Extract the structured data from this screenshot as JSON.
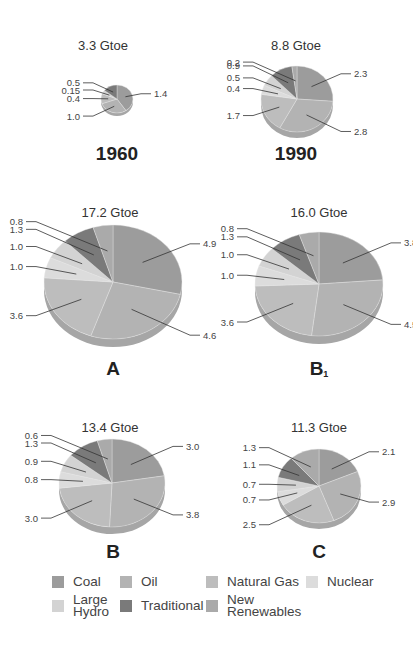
{
  "categories": [
    "Coal",
    "Oil",
    "Natural Gas",
    "Nuclear",
    "Large Hydro",
    "Traditional",
    "New Renewables"
  ],
  "colors": {
    "Coal": "#9c9c9c",
    "Oil": "#b3b3b3",
    "Natural Gas": "#bdbdbd",
    "Nuclear": "#dcdcdc",
    "Large Hydro": "#d3d3d3",
    "Traditional": "#7a7a7a",
    "New Renewables": "#aaaaaa"
  },
  "legend": {
    "items": [
      {
        "label": "Coal",
        "color": "#9c9c9c"
      },
      {
        "label": "Oil",
        "color": "#b3b3b3"
      },
      {
        "label": "Natural Gas",
        "color": "#bdbdbd"
      },
      {
        "label": "Nuclear",
        "color": "#dcdcdc"
      },
      {
        "label": "Large\nHydro",
        "color": "#d3d3d3"
      },
      {
        "label": "Traditional",
        "color": "#7a7a7a"
      },
      {
        "label": "New\nRenewables",
        "color": "#aaaaaa"
      }
    ]
  },
  "chart_data": [
    {
      "type": "pie",
      "title": "1960",
      "total_label": "3.3 Gtoe",
      "total": 3.3,
      "categories": [
        "Coal",
        "Oil",
        "Natural Gas",
        "Nuclear",
        "Large Hydro",
        "Traditional",
        "New Renewables"
      ],
      "values": [
        1.4,
        1.0,
        0.4,
        0.0,
        0.15,
        0.5,
        0.0
      ],
      "labels": {
        "Coal": "1.4",
        "Oil": "1.0",
        "Natural Gas": "0.4",
        "Large Hydro": "0.15",
        "Traditional": "0.5"
      }
    },
    {
      "type": "pie",
      "title": "1990",
      "total_label": "8.8 Gtoe",
      "total": 8.8,
      "categories": [
        "Coal",
        "Oil",
        "Natural Gas",
        "Nuclear",
        "Large Hydro",
        "Traditional",
        "New Renewables"
      ],
      "values": [
        2.3,
        2.8,
        1.7,
        0.4,
        0.5,
        0.9,
        0.2
      ],
      "labels": {
        "Coal": "2.3",
        "Oil": "2.8",
        "Natural Gas": "1.7",
        "Nuclear": "0.4",
        "Large Hydro": "0.5",
        "Traditional": "0.9",
        "New Renewables": "0.2"
      }
    },
    {
      "type": "pie",
      "title": "A",
      "total_label": "17.2 Gtoe",
      "total": 17.2,
      "categories": [
        "Coal",
        "Oil",
        "Natural Gas",
        "Nuclear",
        "Large Hydro",
        "Traditional",
        "New Renewables"
      ],
      "values": [
        4.9,
        4.6,
        3.6,
        1.0,
        1.0,
        1.3,
        0.8
      ],
      "labels": {
        "Coal": "4.9",
        "Oil": "4.6",
        "Natural Gas": "3.6",
        "Nuclear": "1.0",
        "Large Hydro": "1.0",
        "Traditional": "1.3",
        "New Renewables": "0.8"
      }
    },
    {
      "type": "pie",
      "title": "B1",
      "total_label": "16.0 Gtoe",
      "total": 16.0,
      "categories": [
        "Coal",
        "Oil",
        "Natural Gas",
        "Nuclear",
        "Large Hydro",
        "Traditional",
        "New Renewables"
      ],
      "values": [
        3.8,
        4.5,
        3.6,
        1.0,
        1.0,
        1.3,
        0.8
      ],
      "labels": {
        "Coal": "3.8",
        "Oil": "4.5",
        "Natural Gas": "3.6",
        "Nuclear": "1.0",
        "Large Hydro": "1.0",
        "Traditional": "1.3",
        "New Renewables": "0.8"
      }
    },
    {
      "type": "pie",
      "title": "B",
      "total_label": "13.4 Gtoe",
      "total": 13.4,
      "categories": [
        "Coal",
        "Oil",
        "Natural Gas",
        "Nuclear",
        "Large Hydro",
        "Traditional",
        "New Renewables"
      ],
      "values": [
        3.0,
        3.8,
        3.0,
        0.8,
        0.9,
        1.3,
        0.6
      ],
      "labels": {
        "Coal": "3.0",
        "Oil": "3.8",
        "Natural Gas": "3.0",
        "Nuclear": "0.8",
        "Large Hydro": "0.9",
        "Traditional": "1.3",
        "New Renewables": "0.6"
      }
    },
    {
      "type": "pie",
      "title": "C",
      "total_label": "11.3 Gtoe",
      "total": 11.3,
      "categories": [
        "Coal",
        "Oil",
        "Natural Gas",
        "Nuclear",
        "Large Hydro",
        "Traditional",
        "New Renewables"
      ],
      "values": [
        2.1,
        2.9,
        2.5,
        0.7,
        0.7,
        1.1,
        1.3
      ],
      "labels": {
        "Coal": "2.1",
        "Oil": "2.9",
        "Natural Gas": "2.5",
        "Nuclear": "0.7",
        "Large Hydro": "0.7",
        "Traditional": "1.1",
        "New Renewables": "1.3"
      }
    }
  ],
  "panels": [
    {
      "total_label": "3.3 Gtoe",
      "scenario": "1960"
    },
    {
      "total_label": "8.8 Gtoe",
      "scenario": "1990"
    },
    {
      "total_label": "17.2 Gtoe",
      "scenario": "A"
    },
    {
      "total_label": "16.0 Gtoe",
      "scenario": "B",
      "scenario_sub": "1"
    },
    {
      "total_label": "13.4 Gtoe",
      "scenario": "B"
    },
    {
      "total_label": "11.3 Gtoe",
      "scenario": "C"
    }
  ]
}
